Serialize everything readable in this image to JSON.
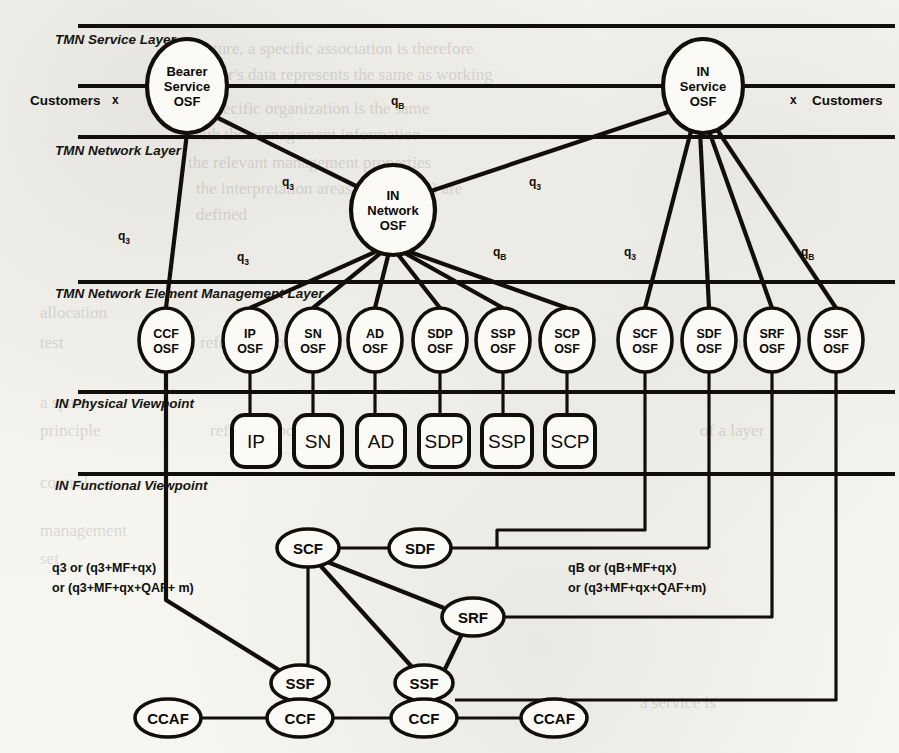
{
  "figure": {
    "type": "diagram"
  },
  "layers": [
    {
      "id": "service",
      "label": "TMN Service Layer",
      "label_x": 55,
      "label_y": 44,
      "rule_y": 26,
      "rule_weight": "thick"
    },
    {
      "id": "customers_rule",
      "label": "",
      "rule_y": 86,
      "rule_weight": "thick"
    },
    {
      "id": "network",
      "label": "TMN Network Layer",
      "label_x": 55,
      "label_y": 155,
      "rule_y": 137,
      "rule_weight": "thick"
    },
    {
      "id": "nem",
      "label": "TMN Network Element Management Layer",
      "label_x": 55,
      "label_y": 298,
      "rule_y": 282,
      "rule_weight": "thick"
    },
    {
      "id": "physical",
      "label": "IN Physical Viewpoint",
      "label_x": 55,
      "label_y": 408,
      "rule_y": 392,
      "rule_weight": "thick"
    },
    {
      "id": "functional",
      "label": "IN Functional Viewpoint",
      "label_x": 55,
      "label_y": 490,
      "rule_y": 474,
      "rule_weight": "thick"
    }
  ],
  "customers": {
    "left_label": "Customers",
    "left_x_mark": "x",
    "right_x_mark": "x",
    "right_label": "Customers"
  },
  "osf_top": [
    {
      "id": "bearer-service-osf",
      "lines": [
        "Bearer",
        "Service",
        "OSF"
      ],
      "cx": 187,
      "cy": 86,
      "rx": 40,
      "ry": 47
    },
    {
      "id": "in-service-osf",
      "lines": [
        "IN",
        "Service",
        "OSF"
      ],
      "cx": 703,
      "cy": 86,
      "rx": 40,
      "ry": 47
    }
  ],
  "osf_network": [
    {
      "id": "in-network-osf",
      "lines": [
        "IN",
        "Network",
        "OSF"
      ],
      "cx": 393,
      "cy": 210,
      "rx": 42,
      "ry": 45
    }
  ],
  "osf_element": [
    {
      "id": "ccf-osf",
      "lines": [
        "CCF",
        "OSF"
      ],
      "cx": 166,
      "cy": 340,
      "rx": 27,
      "ry": 32
    },
    {
      "id": "ip-osf",
      "lines": [
        "IP",
        "OSF"
      ],
      "cx": 250,
      "cy": 340,
      "rx": 27,
      "ry": 32
    },
    {
      "id": "sn-osf",
      "lines": [
        "SN",
        "OSF"
      ],
      "cx": 313,
      "cy": 340,
      "rx": 27,
      "ry": 32
    },
    {
      "id": "ad-osf",
      "lines": [
        "AD",
        "OSF"
      ],
      "cx": 375,
      "cy": 340,
      "rx": 27,
      "ry": 32
    },
    {
      "id": "sdp-osf",
      "lines": [
        "SDP",
        "OSF"
      ],
      "cx": 440,
      "cy": 340,
      "rx": 27,
      "ry": 32
    },
    {
      "id": "ssp-osf",
      "lines": [
        "SSP",
        "OSF"
      ],
      "cx": 503,
      "cy": 340,
      "rx": 27,
      "ry": 32
    },
    {
      "id": "scp-osf",
      "lines": [
        "SCP",
        "OSF"
      ],
      "cx": 567,
      "cy": 340,
      "rx": 27,
      "ry": 32
    },
    {
      "id": "scf-osf",
      "lines": [
        "SCF",
        "OSF"
      ],
      "cx": 645,
      "cy": 340,
      "rx": 27,
      "ry": 32
    },
    {
      "id": "sdf-osf",
      "lines": [
        "SDF",
        "OSF"
      ],
      "cx": 709,
      "cy": 340,
      "rx": 27,
      "ry": 32
    },
    {
      "id": "srf-osf",
      "lines": [
        "SRF",
        "OSF"
      ],
      "cx": 772,
      "cy": 340,
      "rx": 27,
      "ry": 32
    },
    {
      "id": "ssf-osf",
      "lines": [
        "SSF",
        "OSF"
      ],
      "cx": 836,
      "cy": 340,
      "rx": 27,
      "ry": 32
    }
  ],
  "physical_boxes": [
    {
      "id": "ip-box",
      "label": "IP",
      "x": 232,
      "y": 415,
      "w": 48,
      "h": 52
    },
    {
      "id": "sn-box",
      "label": "SN",
      "x": 294,
      "y": 415,
      "w": 48,
      "h": 52
    },
    {
      "id": "ad-box",
      "label": "AD",
      "x": 357,
      "y": 415,
      "w": 48,
      "h": 52
    },
    {
      "id": "sdp-box",
      "label": "SDP",
      "x": 419,
      "y": 415,
      "w": 50,
      "h": 52
    },
    {
      "id": "ssp-box",
      "label": "SSP",
      "x": 482,
      "y": 415,
      "w": 50,
      "h": 52
    },
    {
      "id": "scp-box",
      "label": "SCP",
      "x": 545,
      "y": 415,
      "w": 50,
      "h": 52
    }
  ],
  "functional_nodes": [
    {
      "id": "scf-node",
      "label": "SCF",
      "cx": 308,
      "cy": 548,
      "rx": 31,
      "ry": 19
    },
    {
      "id": "sdf-node",
      "label": "SDF",
      "cx": 420,
      "cy": 548,
      "rx": 31,
      "ry": 19
    },
    {
      "id": "srf-node",
      "label": "SRF",
      "cx": 473,
      "cy": 617,
      "rx": 31,
      "ry": 19
    },
    {
      "id": "ssf-node-1",
      "label": "SSF",
      "cx": 300,
      "cy": 683,
      "rx": 29,
      "ry": 18
    },
    {
      "id": "ssf-node-2",
      "label": "SSF",
      "cx": 424,
      "cy": 683,
      "rx": 29,
      "ry": 18
    },
    {
      "id": "ccaf-node-1",
      "label": "CCAF",
      "cx": 168,
      "cy": 718,
      "rx": 33,
      "ry": 19
    },
    {
      "id": "ccf-node-1",
      "label": "CCF",
      "cx": 300,
      "cy": 718,
      "rx": 33,
      "ry": 19
    },
    {
      "id": "ccf-node-2",
      "label": "CCF",
      "cx": 424,
      "cy": 718,
      "rx": 33,
      "ry": 19
    },
    {
      "id": "ccaf-node-2",
      "label": "CCAF",
      "cx": 554,
      "cy": 718,
      "rx": 33,
      "ry": 19
    }
  ],
  "interface_labels": [
    {
      "id": "q-bearer-right",
      "base": "q",
      "sub": "B",
      "x": 391,
      "y": 105
    },
    {
      "id": "q3-left-a",
      "base": "q",
      "sub": "3",
      "x": 282,
      "y": 186
    },
    {
      "id": "q3-right-a",
      "base": "q",
      "sub": "3",
      "x": 529,
      "y": 186
    },
    {
      "id": "q3-ccf",
      "base": "q",
      "sub": "3",
      "x": 118,
      "y": 240
    },
    {
      "id": "q3-innet-left",
      "base": "q",
      "sub": "3",
      "x": 237,
      "y": 261
    },
    {
      "id": "qB-innet",
      "base": "q",
      "sub": "B",
      "x": 493,
      "y": 256
    },
    {
      "id": "q3-inserv-left",
      "base": "q",
      "sub": "3",
      "x": 624,
      "y": 256
    },
    {
      "id": "qB-inserv",
      "base": "q",
      "sub": "B",
      "x": 801,
      "y": 256
    }
  ],
  "annotations": [
    {
      "id": "left-interface-annotation",
      "x": 52,
      "y": 572,
      "line1": "q3 or (q3+MF+qx)",
      "line2": "or (q3+MF+qx+QAF+ m)"
    },
    {
      "id": "right-interface-annotation",
      "x": 568,
      "y": 572,
      "line1": "qB or (qB+MF+qx)",
      "line2": "or (q3+MF+qx+QAF+m)"
    }
  ],
  "colors": {
    "ink": "#120f0a",
    "paper": "#f7f6f2",
    "node_fill": "#fbfaf6"
  },
  "ghost_text": [
    {
      "x": 180,
      "y": 36,
      "text": "structure, a specific association is therefore"
    },
    {
      "x": 190,
      "y": 62,
      "text": "A user's data represents the same as working"
    },
    {
      "x": 196,
      "y": 96,
      "text": "a specific organization is the same"
    },
    {
      "x": 190,
      "y": 122,
      "text": "with the management information"
    },
    {
      "x": 188,
      "y": 150,
      "text": "the relevant management properties"
    },
    {
      "x": 196,
      "y": 176,
      "text": "the interpretation areas (Figure 3.8) are"
    },
    {
      "x": 196,
      "y": 202,
      "text": "defined"
    },
    {
      "x": 40,
      "y": 300,
      "text": "allocation"
    },
    {
      "x": 40,
      "y": 330,
      "text": "test"
    },
    {
      "x": 200,
      "y": 330,
      "text": "reference point"
    },
    {
      "x": 40,
      "y": 390,
      "text": "a space"
    },
    {
      "x": 40,
      "y": 418,
      "text": "principle"
    },
    {
      "x": 210,
      "y": 418,
      "text": "reference point"
    },
    {
      "x": 40,
      "y": 470,
      "text": "control"
    },
    {
      "x": 40,
      "y": 518,
      "text": "management"
    },
    {
      "x": 40,
      "y": 546,
      "text": "set"
    },
    {
      "x": 700,
      "y": 330,
      "text": "a domain"
    },
    {
      "x": 700,
      "y": 418,
      "text": "of a layer"
    },
    {
      "x": 640,
      "y": 690,
      "text": "a service is"
    }
  ]
}
